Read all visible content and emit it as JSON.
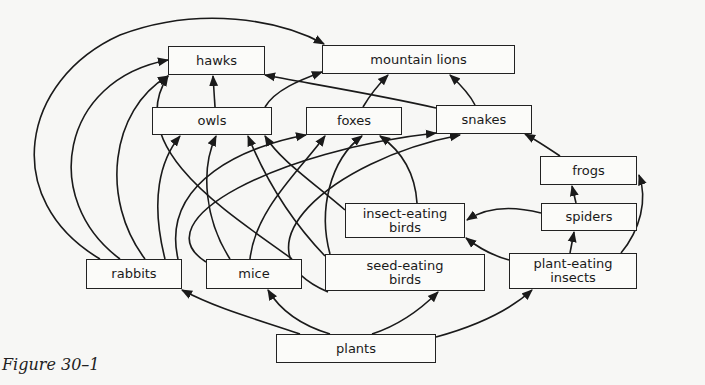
{
  "caption": "Figure 30–1",
  "colors": {
    "line": "#1a1a1a",
    "background": "#f7f7f5",
    "box_fill": "#fbfbf9"
  },
  "nodes": {
    "hawks": {
      "label": "hawks",
      "x": 168,
      "y": 46,
      "w": 97,
      "h": 29
    },
    "lions": {
      "label": "mountain lions",
      "x": 322,
      "y": 45,
      "w": 193,
      "h": 29
    },
    "owls": {
      "label": "owls",
      "x": 152,
      "y": 107,
      "w": 120,
      "h": 28
    },
    "foxes": {
      "label": "foxes",
      "x": 306,
      "y": 107,
      "w": 96,
      "h": 28
    },
    "snakes": {
      "label": "snakes",
      "x": 436,
      "y": 105,
      "w": 96,
      "h": 29
    },
    "frogs": {
      "label": "frogs",
      "x": 540,
      "y": 156,
      "w": 97,
      "h": 29
    },
    "insectbirds": {
      "label": "insect-eating\nbirds",
      "x": 345,
      "y": 203,
      "w": 120,
      "h": 35
    },
    "spiders": {
      "label": "spiders",
      "x": 541,
      "y": 203,
      "w": 96,
      "h": 28
    },
    "rabbits": {
      "label": "rabbits",
      "x": 86,
      "y": 259,
      "w": 96,
      "h": 30
    },
    "mice": {
      "label": "mice",
      "x": 206,
      "y": 259,
      "w": 96,
      "h": 30
    },
    "seedbirds": {
      "label": "seed-eating\nbirds",
      "x": 325,
      "y": 254,
      "w": 160,
      "h": 37
    },
    "insects": {
      "label": "plant-eating\ninsects",
      "x": 509,
      "y": 253,
      "w": 128,
      "h": 36
    },
    "plants": {
      "label": "plants",
      "x": 276,
      "y": 334,
      "w": 160,
      "h": 29
    }
  },
  "edges": [
    {
      "from": "plants",
      "to": "rabbits",
      "d": "M 300 334 C 260 320, 220 310, 182 290"
    },
    {
      "from": "plants",
      "to": "mice",
      "d": "M 330 334 C 300 325, 280 310, 268 290"
    },
    {
      "from": "plants",
      "to": "seedbirds",
      "d": "M 372 334 C 400 325, 420 310, 438 292"
    },
    {
      "from": "plants",
      "to": "insects",
      "d": "M 436 337 C 480 325, 510 310, 532 290"
    },
    {
      "from": "rabbits",
      "to": "lions",
      "d": "M 100 259 C 0 200, 20 80, 120 35 C 200 5, 280 20, 324 44"
    },
    {
      "from": "rabbits",
      "to": "hawks",
      "d": "M 120 259 C 40 200, 60 80, 168 60"
    },
    {
      "from": "rabbits",
      "to": "hawks",
      "d": "M 145 259 C 100 200, 110 110, 168 76"
    },
    {
      "from": "rabbits",
      "to": "owls",
      "d": "M 165 259 C 150 200, 160 160, 180 136"
    },
    {
      "from": "rabbits",
      "to": "foxes",
      "d": "M 178 259 C 160 180, 250 145, 306 135"
    },
    {
      "from": "mice",
      "to": "owls",
      "d": "M 230 259 C 205 220, 200 170, 216 136"
    },
    {
      "from": "mice",
      "to": "foxes",
      "d": "M 250 259 C 255 210, 300 170, 325 136"
    },
    {
      "from": "mice",
      "to": "snakes",
      "d": "M 206 262 C 140 220, 280 150, 436 133"
    },
    {
      "from": "mice",
      "to": "hawks",
      "d": "M 292 259 C 240 220, 120 150, 168 76"
    },
    {
      "from": "seedbirds",
      "to": "owls",
      "d": "M 325 256 C 300 230, 270 190, 248 136"
    },
    {
      "from": "seedbirds",
      "to": "foxes",
      "d": "M 330 254 C 318 210, 330 160, 362 136"
    },
    {
      "from": "seedbirds",
      "to": "snakes",
      "d": "M 328 292 C 230 250, 330 160, 460 135"
    },
    {
      "from": "insectbirds",
      "to": "owls",
      "d": "M 345 210 C 310 180, 280 160, 265 136"
    },
    {
      "from": "insectbirds",
      "to": "foxes",
      "d": "M 417 203 C 415 170, 400 150, 380 136"
    },
    {
      "from": "owls",
      "to": "hawks",
      "d": "M 215 107 L 213 76"
    },
    {
      "from": "owls",
      "to": "lions",
      "d": "M 265 107 C 275 90, 300 80, 322 72"
    },
    {
      "from": "foxes",
      "to": "lions",
      "d": "M 363 107 C 370 95, 378 85, 388 75"
    },
    {
      "from": "snakes",
      "to": "lions",
      "d": "M 475 105 C 470 95, 462 86, 450 75"
    },
    {
      "from": "snakes",
      "to": "hawks",
      "d": "M 436 108 C 380 95, 300 82, 265 75"
    },
    {
      "from": "frogs",
      "to": "snakes",
      "d": "M 560 156 C 548 148, 536 140, 525 134"
    },
    {
      "from": "spiders",
      "to": "frogs",
      "d": "M 576 203 L 572 186"
    },
    {
      "from": "spiders",
      "to": "insectbirds",
      "d": "M 541 213 C 510 205, 485 208, 467 220"
    },
    {
      "from": "insects",
      "to": "spiders",
      "d": "M 570 253 L 574 232"
    },
    {
      "from": "insects",
      "to": "insectbirds",
      "d": "M 509 260 C 490 255, 475 245, 466 238"
    },
    {
      "from": "insects",
      "to": "frogs",
      "d": "M 621 253 C 640 230, 648 200, 639 175"
    }
  ]
}
